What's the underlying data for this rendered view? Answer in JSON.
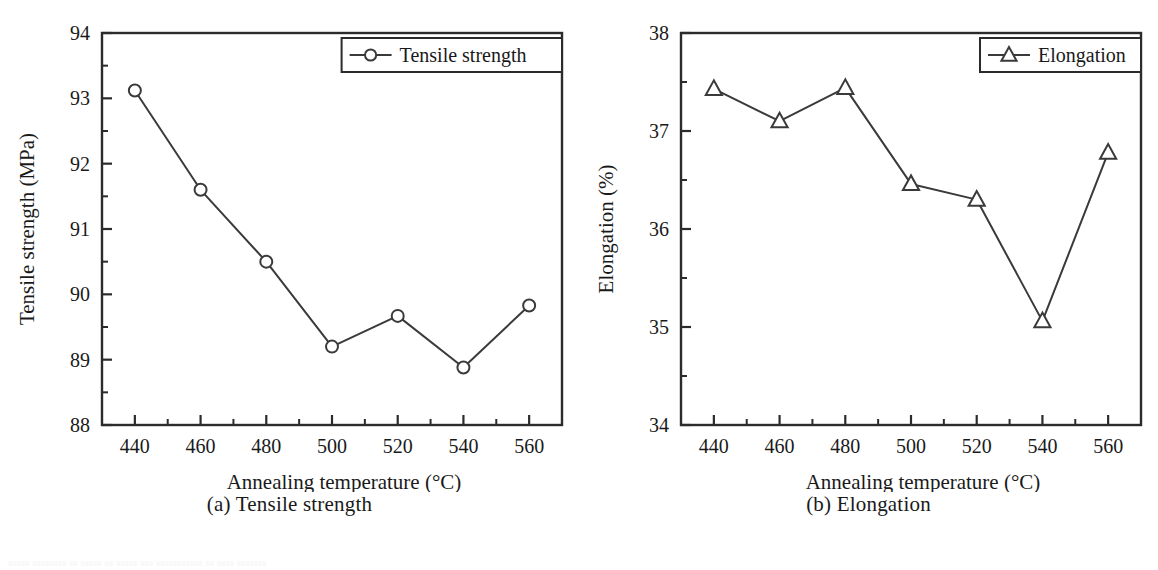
{
  "figure": {
    "background": "#ffffff",
    "axis_color": "#2b2b2b",
    "line_color": "#3a3a3a",
    "marker_fill": "#ffffff",
    "panels": [
      {
        "id": "a",
        "subcaption": "(a) Tensile strength"
      },
      {
        "id": "b",
        "subcaption": "(b) Elongation"
      }
    ],
    "bottom_cropped_text": "sssss ssssssss ss sssss ss sssss sss sssssssssss ss ssss sssssss"
  },
  "chart_data": [
    {
      "type": "line",
      "panel": "a",
      "title": "(a) Tensile strength",
      "xlabel": "Annealing temperature (°C)",
      "ylabel": "Tensile strength (MPa)",
      "legend": "Tensile strength",
      "legend_position": "top-right",
      "marker": "circle-open",
      "grid": false,
      "x": [
        440,
        460,
        480,
        500,
        520,
        540,
        560
      ],
      "xtick_labels": [
        "440",
        "460",
        "480",
        "500",
        "520",
        "540",
        "560"
      ],
      "values": [
        93.12,
        91.6,
        90.5,
        89.2,
        89.67,
        88.88,
        89.83
      ],
      "ytick_labels": [
        "88",
        "89",
        "90",
        "91",
        "92",
        "93",
        "94"
      ],
      "yticks": [
        88,
        89,
        90,
        91,
        92,
        93,
        94
      ],
      "xlim": [
        430,
        570
      ],
      "ylim": [
        88,
        94
      ],
      "y_minor_per_major": 2,
      "x_minor_per_major": 1
    },
    {
      "type": "line",
      "panel": "b",
      "title": "(b) Elongation",
      "xlabel": "Annealing temperature (°C)",
      "ylabel": "Elongation (%)",
      "legend": "Elongation",
      "legend_position": "top-right",
      "marker": "triangle-open",
      "grid": false,
      "x": [
        440,
        460,
        480,
        500,
        520,
        540,
        560
      ],
      "xtick_labels": [
        "440",
        "460",
        "480",
        "500",
        "520",
        "540",
        "560"
      ],
      "values": [
        37.43,
        37.1,
        37.44,
        36.46,
        36.3,
        35.06,
        36.78
      ],
      "ytick_labels": [
        "34",
        "35",
        "36",
        "37",
        "38"
      ],
      "yticks": [
        34,
        35,
        36,
        37,
        38
      ],
      "xlim": [
        430,
        570
      ],
      "ylim": [
        34,
        38
      ],
      "y_minor_per_major": 2,
      "x_minor_per_major": 1
    }
  ]
}
